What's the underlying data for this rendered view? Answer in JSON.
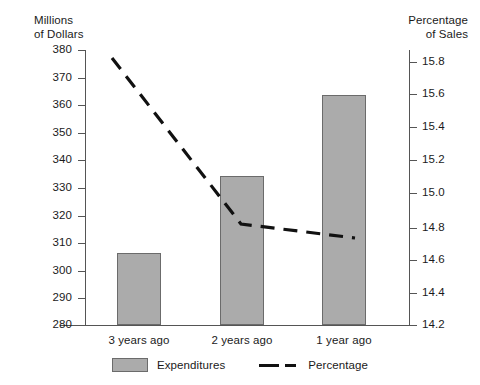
{
  "chart_data": {
    "type": "bar",
    "title": "",
    "subtitle": "",
    "categories": [
      "3 years ago",
      "2 years ago",
      "1 year ago"
    ],
    "series": [
      {
        "name": "Expenditures",
        "type": "bar",
        "axis": "left",
        "values": [
          306,
          334,
          363.5
        ],
        "color": "#ababab"
      },
      {
        "name": "Percentage",
        "type": "line",
        "axis": "right",
        "values": [
          15.83,
          14.86,
          14.77
        ],
        "color": "#111111",
        "style": "dashed"
      }
    ],
    "left_axis": {
      "label": "Millions\nof Dollars",
      "ticks": [
        280,
        290,
        300,
        310,
        320,
        330,
        340,
        350,
        360,
        370,
        380
      ],
      "tick_labels": [
        "280",
        "290",
        "300",
        "310",
        "320",
        "330",
        "340",
        "350",
        "360",
        "370",
        "380"
      ],
      "ylim": [
        280,
        380
      ]
    },
    "right_axis": {
      "label": "Percentage\nof Sales",
      "ticks": [
        14.2,
        14.4,
        14.6,
        14.8,
        15.0,
        15.2,
        15.4,
        15.6,
        15.8
      ],
      "tick_labels": [
        "14.2",
        "14.4",
        "14.6",
        "14.8",
        "15.0",
        "15.2",
        "15.4",
        "15.6",
        "15.8"
      ],
      "ylim": [
        14.2,
        15.9
      ]
    },
    "xlabel": "",
    "grid": false,
    "legend_position": "bottom",
    "legend": [
      {
        "label": "Expenditures",
        "marker": "bar-swatch"
      },
      {
        "label": "Percentage",
        "marker": "dashed-line"
      }
    ]
  },
  "left_axis_title": "Millions\nof Dollars",
  "right_axis_title": "Percentage\nof Sales",
  "left_ticks": [
    {
      "value": "380",
      "y": 50
    },
    {
      "value": "370",
      "y": 77.6
    },
    {
      "value": "360",
      "y": 105.2
    },
    {
      "value": "350",
      "y": 132.8
    },
    {
      "value": "340",
      "y": 160.4
    },
    {
      "value": "330",
      "y": 188
    },
    {
      "value": "320",
      "y": 215.6
    },
    {
      "value": "310",
      "y": 243.2
    },
    {
      "value": "300",
      "y": 270.8
    },
    {
      "value": "290",
      "y": 298.4
    },
    {
      "value": "280",
      "y": 325
    }
  ],
  "right_ticks": [
    {
      "value": "15.8",
      "y": 61.5
    },
    {
      "value": "15.6",
      "y": 94.4
    },
    {
      "value": "15.4",
      "y": 127.2
    },
    {
      "value": "15.2",
      "y": 160.1
    },
    {
      "value": "15.0",
      "y": 193
    },
    {
      "value": "14.8",
      "y": 227.5
    },
    {
      "value": "14.6",
      "y": 260
    },
    {
      "value": "14.4",
      "y": 292.5
    },
    {
      "value": "14.2",
      "y": 325
    }
  ],
  "bars": [
    {
      "label": "3 years ago",
      "value": "306",
      "x": 117,
      "y": 253,
      "w": 44,
      "h": 72
    },
    {
      "label": "2 years ago",
      "value": "334",
      "x": 220,
      "y": 176,
      "w": 44,
      "h": 149
    },
    {
      "label": "1 year ago",
      "value": "363.5",
      "x": 322,
      "y": 95,
      "w": 44,
      "h": 230
    }
  ],
  "category_labels": [
    {
      "text": "3 years ago",
      "left": 84
    },
    {
      "text": "2 years ago",
      "left": 187
    },
    {
      "text": "1 year ago",
      "left": 289
    }
  ],
  "line_points": "112,58 241,224 355,238",
  "legend": {
    "expenditures": "Expenditures",
    "percentage": "Percentage"
  }
}
